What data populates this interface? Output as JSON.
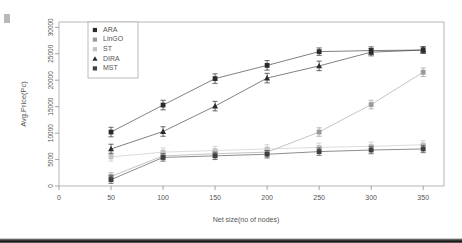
{
  "chart_data": {
    "type": "line",
    "title": "",
    "xlabel": "Net size(no of nodes)",
    "ylabel": "Avg.Price(Pc)",
    "xlim": [
      0,
      370
    ],
    "ylim": [
      0,
      31000
    ],
    "xticks": [
      0,
      50,
      100,
      150,
      200,
      250,
      300,
      350
    ],
    "yticks": [
      0,
      5000,
      10000,
      15000,
      20000,
      25000,
      30000
    ],
    "grid": false,
    "legend_position": "top-left",
    "error_bars": true,
    "x": [
      50,
      100,
      150,
      200,
      250,
      300,
      350
    ],
    "series": [
      {
        "name": "ARA",
        "marker": "square",
        "color": "#2b2b2b",
        "values": [
          10200,
          15300,
          20300,
          22800,
          25400,
          25600,
          25700
        ],
        "errors": [
          900,
          900,
          900,
          900,
          700,
          700,
          600
        ]
      },
      {
        "name": "LinGO",
        "marker": "square",
        "color": "#9a9a9a",
        "values": [
          1800,
          5700,
          6100,
          6400,
          10200,
          15400,
          21500
        ],
        "errors": [
          700,
          700,
          700,
          700,
          800,
          800,
          800
        ]
      },
      {
        "name": "ST",
        "marker": "square",
        "color": "#c4c4c4",
        "values": [
          5500,
          6400,
          6700,
          7000,
          7300,
          7500,
          7800
        ],
        "errors": [
          800,
          800,
          800,
          800,
          800,
          800,
          800
        ]
      },
      {
        "name": "DIRA",
        "marker": "triangle",
        "color": "#2b2b2b",
        "values": [
          7000,
          10300,
          15100,
          20400,
          22700,
          25300,
          25700
        ],
        "errors": [
          900,
          900,
          900,
          900,
          900,
          700,
          600
        ]
      },
      {
        "name": "MST",
        "marker": "square",
        "color": "#3f3f3f",
        "values": [
          1200,
          5400,
          5700,
          6000,
          6500,
          6800,
          7000
        ],
        "errors": [
          700,
          700,
          700,
          700,
          700,
          700,
          700
        ]
      }
    ]
  },
  "legend": {
    "entries": [
      "ARA",
      "LinGO",
      "ST",
      "DIRA",
      "MST"
    ]
  },
  "axes": {
    "x_title": "Net size(no of nodes)",
    "y_title": "Avg.Price(Pc)",
    "x_tick_labels": [
      "0",
      "50",
      "100",
      "150",
      "200",
      "250",
      "300",
      "350"
    ],
    "y_tick_labels": [
      "0",
      "5000",
      "10000",
      "15000",
      "20000",
      "25000",
      "30000"
    ]
  }
}
